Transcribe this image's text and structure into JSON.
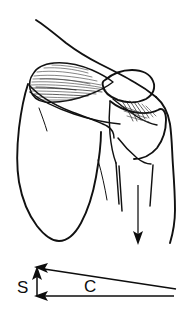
{
  "figure": {
    "background_color": "#ffffff",
    "ink_color": "#111111",
    "width": 193,
    "height": 310
  },
  "anatomy": {
    "parts": [
      {
        "id": "neck-trapezius-contour",
        "label": "neck and trapezius contour"
      },
      {
        "id": "supraspinatus-muscle",
        "label": "supraspinatus muscle"
      },
      {
        "id": "scapula-body",
        "label": "scapula"
      },
      {
        "id": "scapular-spine",
        "label": "scapular spine"
      },
      {
        "id": "acromion-clavicle",
        "label": "acromion and clavicle"
      },
      {
        "id": "humeral-head",
        "label": "humeral head"
      },
      {
        "id": "supraspinatus-tendon",
        "label": "supraspinatus tendon insertion"
      },
      {
        "id": "humerus-shaft",
        "label": "humerus shaft"
      },
      {
        "id": "arm-outline",
        "label": "arm soft tissue outline"
      }
    ],
    "load_arrow": {
      "id": "humerus-load-arrow",
      "label": "downward load on humerus",
      "direction": "down"
    }
  },
  "vector_diagram": {
    "resultant": {
      "key": "R",
      "label": "",
      "description": "resultant vector, arrow pointing up and to the left"
    },
    "components": [
      {
        "key": "S",
        "label": "S",
        "direction": "up",
        "description": "shear component, short vertical arrow pointing up"
      },
      {
        "key": "C",
        "label": "C",
        "direction": "left",
        "description": "compression component, long horizontal arrow pointing left"
      }
    ],
    "label_color": "#0d0d0d"
  }
}
